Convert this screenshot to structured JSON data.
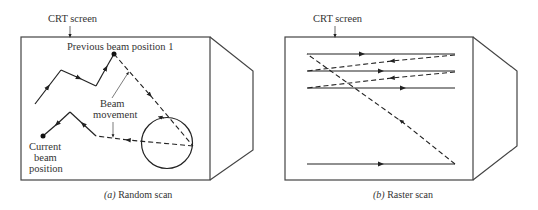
{
  "panel_a": {
    "crt_label": "CRT screen",
    "prev_label": "Previous beam position 1",
    "beam_label_1": "Beam",
    "beam_label_2": "movement",
    "current_label_1": "Current",
    "current_label_2": "beam",
    "current_label_3": "position",
    "caption_letter": "(a)",
    "caption_text": " Random scan"
  },
  "panel_b": {
    "crt_label": "CRT screen",
    "caption_letter": "(b)",
    "caption_text": " Raster scan"
  },
  "colors": {
    "stroke": "#333333",
    "background": "#ffffff"
  }
}
